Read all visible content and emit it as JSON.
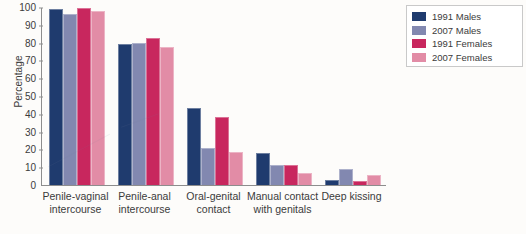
{
  "chart_data": {
    "type": "bar",
    "title": "",
    "xlabel": "",
    "ylabel": "Percentage",
    "ylim": [
      0,
      100
    ],
    "yticks": [
      0,
      10,
      20,
      30,
      40,
      50,
      60,
      70,
      80,
      90,
      100
    ],
    "grid": false,
    "legend_position": "top-right",
    "categories": [
      "Penile-vaginal\nintercourse",
      "Penile-anal\nintercourse",
      "Oral-genital\ncontact",
      "Manual contact\nwith genitals",
      "Deep kissing"
    ],
    "series": [
      {
        "name": "1991 Males",
        "color": "#1f3b6e",
        "values": [
          99,
          79,
          43,
          18,
          3
        ]
      },
      {
        "name": "2007 Males",
        "color": "#8288b0",
        "values": [
          96,
          80,
          21,
          11,
          9
        ]
      },
      {
        "name": "1991 Females",
        "color": "#c8275e",
        "values": [
          99.5,
          82.5,
          38,
          11.5,
          2
        ]
      },
      {
        "name": "2007 Females",
        "color": "#e28ca6",
        "values": [
          98,
          77.5,
          18.5,
          7,
          5.5
        ]
      }
    ]
  },
  "axis": {
    "y_label": "Percentage"
  },
  "colors": {
    "axis_line": "#8d8d8d",
    "background": "#fdfcfa",
    "legend_border": "#c9c9c9",
    "text": "#3b3b3b"
  }
}
